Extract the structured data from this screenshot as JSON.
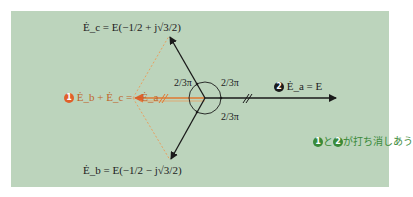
{
  "diagram": {
    "colors": {
      "panel_bg": "#bcd4bc",
      "vector": "#1a1a1a",
      "orange": "#e07830",
      "badge_orange": "#e0602a",
      "badge_dark": "#1a1a1a",
      "note_green": "#3a8a3a"
    },
    "vectors": {
      "ec": {
        "label": "Ė_c = E(−1/2 + j√3/2)"
      },
      "eb": {
        "label": "Ė_b = E(−1/2 − j√3/2)"
      },
      "ea": {
        "badge": "2",
        "label": "Ė_a = E"
      },
      "sum": {
        "badge": "1",
        "label": "Ė_b + Ė_c = −Ė_a"
      }
    },
    "angles": [
      {
        "label_num": "2",
        "label_den": "3",
        "label_pi": "π",
        "position": "upper-left"
      },
      {
        "label_num": "2",
        "label_den": "3",
        "label_pi": "π",
        "position": "upper-right"
      },
      {
        "label_num": "2",
        "label_den": "3",
        "label_pi": "π",
        "position": "lower-right"
      }
    ],
    "note": {
      "badge1": "1",
      "text1": "と",
      "badge2": "2",
      "text2": "が打ち消しあう"
    }
  }
}
